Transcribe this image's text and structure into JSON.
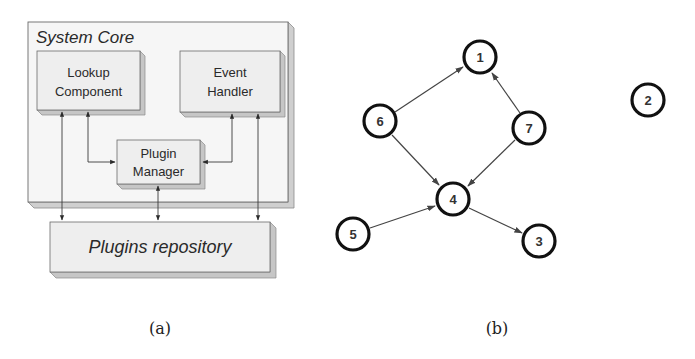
{
  "colors": {
    "box_fill": "#eeeeee",
    "box_stroke": "#6a6a6a",
    "edge_3d": "#bdbdbd",
    "arrow": "#3a3a3a",
    "node_stroke": "#111111",
    "node_fill": "#ffffff"
  },
  "panel_a": {
    "caption": "(a)",
    "system_core": {
      "title": "System Core"
    },
    "lookup_component": {
      "line1": "Lookup",
      "line2": "Component"
    },
    "event_handler": {
      "line1": "Event",
      "line2": "Handler"
    },
    "plugin_manager": {
      "line1": "Plugin",
      "line2": "Manager"
    },
    "plugins_repository": {
      "title": "Plugins repository"
    }
  },
  "panel_b": {
    "caption": "(b)",
    "nodes": [
      {
        "id": "1",
        "label": "1"
      },
      {
        "id": "2",
        "label": "2"
      },
      {
        "id": "3",
        "label": "3"
      },
      {
        "id": "4",
        "label": "4"
      },
      {
        "id": "5",
        "label": "5"
      },
      {
        "id": "6",
        "label": "6"
      },
      {
        "id": "7",
        "label": "7"
      }
    ],
    "edges": [
      {
        "from": "6",
        "to": "1"
      },
      {
        "from": "7",
        "to": "1"
      },
      {
        "from": "6",
        "to": "4"
      },
      {
        "from": "7",
        "to": "4"
      },
      {
        "from": "5",
        "to": "4"
      },
      {
        "from": "4",
        "to": "3"
      }
    ]
  }
}
